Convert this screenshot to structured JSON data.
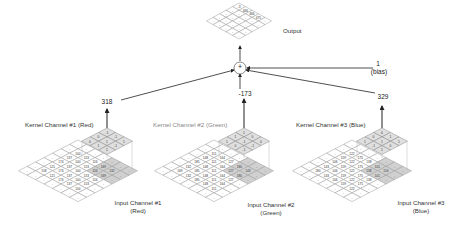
{
  "output": {
    "label": "Output",
    "cells": [
      "-3",
      "466",
      "466",
      "475"
    ]
  },
  "sum_node": {
    "symbol": "+"
  },
  "bias": {
    "value": "1",
    "label": "(bias)"
  },
  "channels": [
    {
      "kernel_label": "Kernel Channel #1 (Red)",
      "input_label_line1": "Input Channel #1",
      "input_label_line2": "(Red)",
      "result": "318",
      "kernel_values": [
        "-1",
        "-1",
        "1",
        "0",
        "1",
        "-1",
        "0",
        "1",
        "1"
      ]
    },
    {
      "kernel_label": "Kernel Channel #2 (Green)",
      "input_label_line1": "Input Channel #2",
      "input_label_line2": "(Green)",
      "result": "-173",
      "kernel_values": [
        "1",
        "0",
        "0",
        "1",
        "-1",
        "-1",
        "1",
        "0",
        "-1"
      ]
    },
    {
      "kernel_label": "Kernel Channel #3 (Blue)",
      "input_label_line1": "Input Channel #3",
      "input_label_line2": "(Blue)",
      "result": "329",
      "kernel_values": [
        "0",
        "1",
        "1",
        "0",
        "1",
        "0",
        "1",
        "-1",
        "1"
      ]
    }
  ],
  "colors": {
    "line": "#222222",
    "grid": "#9a9a9a",
    "kernel_fill": "#d9d9d9",
    "highlight_fill": "#cfcfcf"
  }
}
